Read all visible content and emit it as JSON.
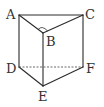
{
  "diagram": {
    "type": "triangular-prism",
    "vertices": {
      "A": {
        "label": "A",
        "x": 19,
        "y": 15
      },
      "B": {
        "label": "B",
        "x": 43,
        "y": 33
      },
      "C": {
        "label": "C",
        "x": 83,
        "y": 15
      },
      "D": {
        "label": "D",
        "x": 19,
        "y": 67
      },
      "E": {
        "label": "E",
        "x": 43,
        "y": 86
      },
      "F": {
        "label": "F",
        "x": 83,
        "y": 67
      }
    },
    "edges_visible": [
      "AB",
      "BC",
      "AC",
      "AD",
      "BE",
      "CF",
      "DE",
      "EF"
    ],
    "edges_hidden": [
      "DF"
    ],
    "right_angle_at": "B",
    "colors": {
      "line": "#2a2a2a",
      "label": "#333333",
      "background": "#ffffff"
    }
  }
}
